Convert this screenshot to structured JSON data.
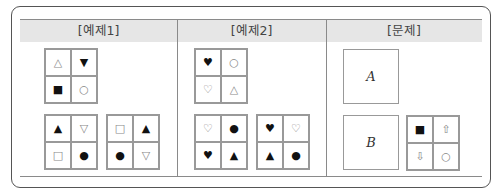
{
  "columns": [
    {
      "label": "[예제1]"
    },
    {
      "label": "[예제2]"
    },
    {
      "label": "[문제]"
    }
  ],
  "example1": {
    "top_grid": [
      {
        "symbol": "△",
        "icon": "white-triangle-up-icon",
        "tone": "light"
      },
      {
        "symbol": "▼",
        "icon": "black-triangle-down-icon",
        "tone": "dark"
      },
      {
        "symbol": "■",
        "icon": "black-square-icon",
        "tone": "dark"
      },
      {
        "symbol": "○",
        "icon": "white-circle-icon",
        "tone": "light"
      }
    ],
    "bottom_left_grid": [
      {
        "symbol": "▲",
        "icon": "black-triangle-up-icon",
        "tone": "dark"
      },
      {
        "symbol": "▽",
        "icon": "white-triangle-down-icon",
        "tone": "light"
      },
      {
        "symbol": "□",
        "icon": "white-square-icon",
        "tone": "light"
      },
      {
        "symbol": "●",
        "icon": "black-circle-icon",
        "tone": "dark"
      }
    ],
    "bottom_right_grid": [
      {
        "symbol": "□",
        "icon": "white-square-icon",
        "tone": "light"
      },
      {
        "symbol": "▲",
        "icon": "black-triangle-up-icon",
        "tone": "dark"
      },
      {
        "symbol": "●",
        "icon": "black-circle-icon",
        "tone": "dark"
      },
      {
        "symbol": "▽",
        "icon": "white-triangle-down-icon",
        "tone": "light"
      }
    ]
  },
  "example2": {
    "top_grid": [
      {
        "symbol": "♥",
        "icon": "black-heart-icon",
        "tone": "dark"
      },
      {
        "symbol": "○",
        "icon": "white-circle-icon",
        "tone": "light"
      },
      {
        "symbol": "♡",
        "icon": "white-heart-icon",
        "tone": "light"
      },
      {
        "symbol": "△",
        "icon": "white-triangle-up-icon",
        "tone": "light"
      }
    ],
    "bottom_left_grid": [
      {
        "symbol": "♡",
        "icon": "white-heart-icon",
        "tone": "light"
      },
      {
        "symbol": "●",
        "icon": "black-circle-icon",
        "tone": "dark"
      },
      {
        "symbol": "♥",
        "icon": "black-heart-icon",
        "tone": "dark"
      },
      {
        "symbol": "▲",
        "icon": "black-triangle-up-icon",
        "tone": "dark"
      }
    ],
    "bottom_right_grid": [
      {
        "symbol": "♥",
        "icon": "black-heart-icon",
        "tone": "dark"
      },
      {
        "symbol": "♡",
        "icon": "white-heart-icon",
        "tone": "light"
      },
      {
        "symbol": "▲",
        "icon": "black-triangle-up-icon",
        "tone": "dark"
      },
      {
        "symbol": "●",
        "icon": "black-circle-icon",
        "tone": "dark"
      }
    ]
  },
  "problem": {
    "box_a_label": "A",
    "box_b_label": "B",
    "given_grid": [
      {
        "symbol": "■",
        "icon": "black-square-icon",
        "tone": "dark"
      },
      {
        "symbol": "⇧",
        "icon": "white-arrow-up-icon",
        "tone": "light"
      },
      {
        "symbol": "⇩",
        "icon": "white-arrow-down-icon",
        "tone": "light"
      },
      {
        "symbol": "○",
        "icon": "white-circle-icon",
        "tone": "light"
      }
    ]
  }
}
